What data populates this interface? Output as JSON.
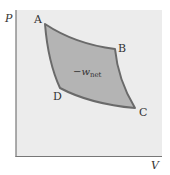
{
  "diagram": {
    "type": "pv-cycle",
    "axes": {
      "y_label": "P",
      "x_label": "V"
    },
    "points": [
      {
        "label": "A"
      },
      {
        "label": "B"
      },
      {
        "label": "C"
      },
      {
        "label": "D"
      }
    ],
    "region_label": {
      "prefix": "−w",
      "subscript": "net"
    },
    "colors": {
      "plot_background": "#ececec",
      "region_fill": "#b4b4b4",
      "curve_stroke": "#6a6a6a",
      "axis": "#777777",
      "text": "#333333"
    }
  }
}
